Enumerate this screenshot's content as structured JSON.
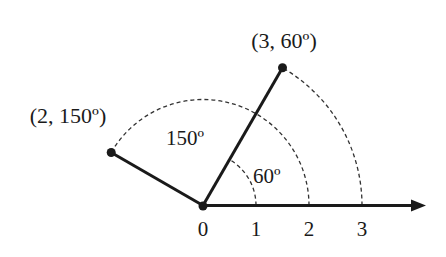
{
  "diagram": {
    "colors": {
      "ink": "#1a1a1a",
      "background": "#ffffff"
    },
    "axis": {
      "tick_labels": [
        "0",
        "1",
        "2",
        "3"
      ],
      "tick_values": [
        0,
        1,
        2,
        3
      ]
    },
    "points": [
      {
        "r": 3,
        "theta_deg": 60,
        "label": "(3, 60º)"
      },
      {
        "r": 2,
        "theta_deg": 150,
        "label": "(2, 150º)"
      }
    ],
    "angle_labels": [
      {
        "theta_deg": 60,
        "radius": 1,
        "label": "60º"
      },
      {
        "theta_deg": 150,
        "radius": 2,
        "label": "150º"
      }
    ]
  }
}
